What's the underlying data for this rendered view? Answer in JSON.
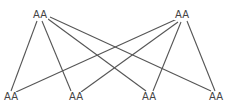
{
  "diagram": {
    "type": "bipartite-graph",
    "nodes": [
      {
        "id": "t1",
        "label": "AA",
        "x": 40,
        "y": 15
      },
      {
        "id": "t2",
        "label": "AA",
        "x": 182,
        "y": 15
      },
      {
        "id": "b1",
        "label": "AA",
        "x": 10,
        "y": 97
      },
      {
        "id": "b2",
        "label": "AA",
        "x": 76,
        "y": 97
      },
      {
        "id": "b3",
        "label": "AA",
        "x": 149,
        "y": 97
      },
      {
        "id": "b4",
        "label": "AA",
        "x": 216,
        "y": 97
      }
    ],
    "edges": [
      [
        "t1",
        "b1"
      ],
      [
        "t1",
        "b2"
      ],
      [
        "t1",
        "b3"
      ],
      [
        "t1",
        "b4"
      ],
      [
        "t2",
        "b1"
      ],
      [
        "t2",
        "b2"
      ],
      [
        "t2",
        "b3"
      ],
      [
        "t2",
        "b4"
      ]
    ],
    "edge_color": "#555555"
  }
}
